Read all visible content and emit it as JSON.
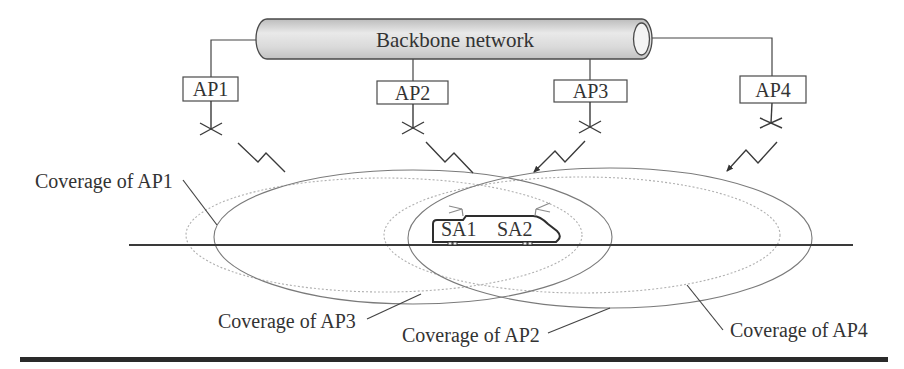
{
  "diagram": {
    "backbone": {
      "label": "Backbone network"
    },
    "access_points": [
      {
        "id": "AP1",
        "label": "AP1"
      },
      {
        "id": "AP2",
        "label": "AP2"
      },
      {
        "id": "AP3",
        "label": "AP3"
      },
      {
        "id": "AP4",
        "label": "AP4"
      }
    ],
    "train": {
      "antennas": [
        {
          "label": "SA1"
        },
        {
          "label": "SA2"
        }
      ]
    },
    "coverage_labels": [
      {
        "ap": "AP1",
        "label": "Coverage of AP1",
        "style": "solid"
      },
      {
        "ap": "AP2",
        "label": "Coverage of AP2",
        "style": "solid"
      },
      {
        "ap": "AP3",
        "label": "Coverage of AP3",
        "style": "dotted"
      },
      {
        "ap": "AP4",
        "label": "Coverage of AP4",
        "style": "dotted"
      }
    ]
  },
  "colors": {
    "text": "#333333",
    "lines": "#3a3a3a",
    "coverage_solid": "#7a7a7a",
    "coverage_dotted": "#b0b0b0",
    "backbone_fill": "#dcdcdc",
    "bottom_rule": "#2a2a2a"
  }
}
